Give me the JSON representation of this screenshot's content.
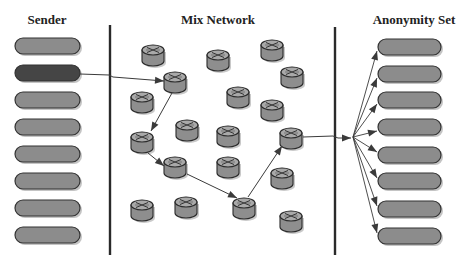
{
  "titles": {
    "sender": "Sender",
    "mix_network": "Mix Network",
    "anonymity_set": "Anonymity Set"
  },
  "colors": {
    "pill_fill": "#8c8c8c",
    "pill_active_fill": "#454545",
    "pill_stroke": "#333333",
    "pill_shadow": "#c4c4c4",
    "router_top": "#a9a9a9",
    "router_body": "#8e8e8e",
    "router_stroke": "#2a2a2a",
    "divider": "#2a2a2a",
    "arrow": "#3a3a3a"
  },
  "diagram": {
    "dividers": [
      {
        "name": "sender-mix-divider",
        "x": 110,
        "y1": 25,
        "y2": 255
      },
      {
        "name": "mix-anonymity-divider",
        "x": 335,
        "y1": 27,
        "y2": 255
      }
    ],
    "senders": {
      "x": 15,
      "width": 65,
      "height": 16,
      "items": [
        {
          "y": 46,
          "active": false
        },
        {
          "y": 73,
          "active": true
        },
        {
          "y": 100,
          "active": false
        },
        {
          "y": 127,
          "active": false
        },
        {
          "y": 154,
          "active": false
        },
        {
          "y": 181,
          "active": false
        },
        {
          "y": 208,
          "active": false
        },
        {
          "y": 235,
          "active": false
        }
      ]
    },
    "anonymity_set": {
      "x": 378,
      "width": 63,
      "height": 16,
      "items": [
        {
          "y": 47
        },
        {
          "y": 74
        },
        {
          "y": 100
        },
        {
          "y": 127
        },
        {
          "y": 155
        },
        {
          "y": 181
        },
        {
          "y": 209
        },
        {
          "y": 236
        }
      ]
    },
    "routers": [
      {
        "x": 153,
        "y": 55
      },
      {
        "x": 175,
        "y": 82
      },
      {
        "x": 218,
        "y": 60
      },
      {
        "x": 272,
        "y": 50
      },
      {
        "x": 292,
        "y": 77
      },
      {
        "x": 142,
        "y": 102
      },
      {
        "x": 238,
        "y": 97
      },
      {
        "x": 272,
        "y": 110
      },
      {
        "x": 187,
        "y": 130
      },
      {
        "x": 228,
        "y": 136
      },
      {
        "x": 142,
        "y": 142
      },
      {
        "x": 291,
        "y": 138
      },
      {
        "x": 175,
        "y": 167
      },
      {
        "x": 228,
        "y": 167
      },
      {
        "x": 282,
        "y": 178
      },
      {
        "x": 142,
        "y": 210
      },
      {
        "x": 186,
        "y": 207
      },
      {
        "x": 244,
        "y": 208
      },
      {
        "x": 291,
        "y": 221
      }
    ],
    "route_arrows": [
      {
        "name": "sender-to-mix-arrow",
        "points": [
          [
            80,
            74
          ],
          [
            109,
            75
          ],
          [
            113,
            77
          ],
          [
            164,
            81
          ]
        ]
      },
      {
        "name": "hop-1-arrow",
        "points": [
          [
            172,
            93
          ],
          [
            151,
            131
          ]
        ]
      },
      {
        "name": "hop-2-arrow",
        "points": [
          [
            148,
            153
          ],
          [
            164,
            166
          ]
        ]
      },
      {
        "name": "hop-3-arrow",
        "points": [
          [
            187,
            174
          ],
          [
            237,
            198
          ]
        ]
      },
      {
        "name": "hop-4-arrow",
        "points": [
          [
            248,
            197
          ],
          [
            282,
            146
          ]
        ]
      },
      {
        "name": "mix-exit-arrow",
        "points": [
          [
            303,
            137
          ],
          [
            333,
            136
          ],
          [
            338,
            138
          ],
          [
            351,
            138
          ]
        ]
      }
    ],
    "fan_origin": [
      353,
      137
    ],
    "fan_target_x": 377
  }
}
